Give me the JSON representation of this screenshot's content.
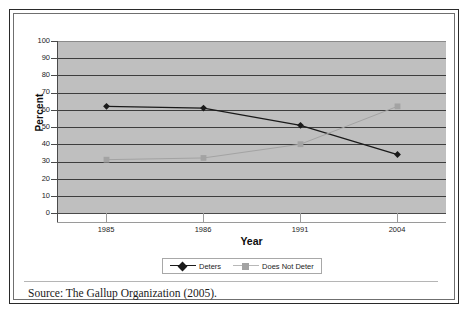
{
  "figure": {
    "source_note": "Source: The Gallup Organization (2005)."
  },
  "chart_data": {
    "type": "line",
    "title": "",
    "xlabel": "Year",
    "ylabel": "Percent",
    "categories": [
      "1985",
      "1986",
      "1991",
      "2004"
    ],
    "ylim": [
      0,
      100
    ],
    "yticks": [
      0,
      10,
      20,
      30,
      40,
      50,
      60,
      70,
      80,
      90,
      100
    ],
    "ytick_labels": [
      "0",
      "10",
      "20",
      "30",
      "40",
      "50",
      "60",
      "70",
      "80",
      "90",
      "100"
    ],
    "grid": true,
    "legend_position": "bottom",
    "plot_background": "#bfbfbf",
    "series": [
      {
        "name": "Deters",
        "values": [
          62,
          61,
          51,
          34
        ],
        "color": "#1a1a1a",
        "marker": "diamond"
      },
      {
        "name": "Does Not Deter",
        "values": [
          31,
          32,
          40,
          62
        ],
        "color": "#a3a3a3",
        "marker": "square"
      }
    ]
  }
}
